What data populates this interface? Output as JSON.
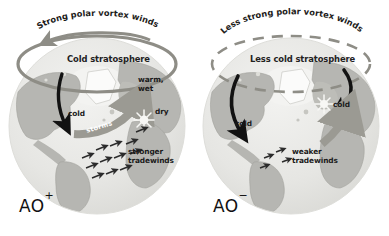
{
  "figure": {
    "background": "#ffffff",
    "colors": {
      "ocean": "#e9e9e7",
      "land": "#b6b6b2",
      "land_light": "#d2d2cd",
      "ice": "#fbfbfa",
      "vortex_ring": "#8e8d86",
      "arrow_black": "#121212",
      "storm_band": "#9b9a93",
      "text": "#1a1a1a"
    }
  },
  "panels": [
    {
      "id": "ao-positive",
      "phase_label": "AO",
      "phase_sign": "+",
      "vortex_caption": "Strong polar vortex winds",
      "vortex_ring_style": "solid",
      "stratosphere_label": "Cold stratosphere",
      "annotations": [
        {
          "name": "cold-label",
          "text": "cold"
        },
        {
          "name": "warm-wet-label",
          "text": "warm,\nwet"
        },
        {
          "name": "dry-label",
          "text": "dry"
        },
        {
          "name": "storms-label",
          "text": "storms"
        },
        {
          "name": "tradewinds-label",
          "text": "stronger\ntradewinds"
        }
      ],
      "tradewind_arrow_count": 12,
      "jet_arrow_count": 1,
      "starburst_count": 1
    },
    {
      "id": "ao-negative",
      "phase_label": "AO",
      "phase_sign": "−",
      "vortex_caption": "Less strong polar vortex winds",
      "vortex_ring_style": "dashed",
      "stratosphere_label": "Less cold stratosphere",
      "annotations": [
        {
          "name": "cold-label-west",
          "text": "cold"
        },
        {
          "name": "cold-label-east",
          "text": "cold"
        },
        {
          "name": "tradewinds-label",
          "text": "weaker\ntradewinds"
        }
      ],
      "tradewind_arrow_count": 4,
      "jet_arrow_count": 2,
      "starburst_count": 1
    }
  ]
}
